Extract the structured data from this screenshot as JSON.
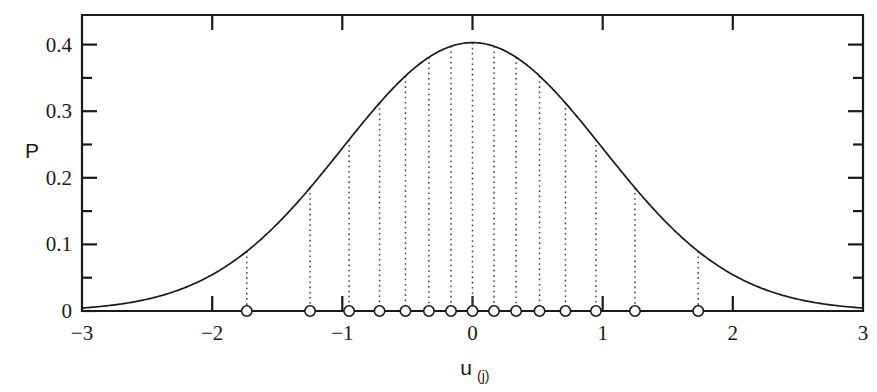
{
  "chart_data": {
    "type": "line",
    "title": "",
    "subtitle": "",
    "xlabel": "u",
    "xlabel_sub": "(j)",
    "ylabel": "P",
    "xlim": [
      -3,
      3
    ],
    "ylim": [
      0,
      0.44
    ],
    "grid": false,
    "legend": null,
    "x_ticks_major": [
      -3,
      -2,
      -1,
      0,
      1,
      2,
      3
    ],
    "x_tick_labels": [
      "−3",
      "−2",
      "−1",
      "0",
      "1",
      "2",
      "3"
    ],
    "y_ticks_major": [
      0,
      0.1,
      0.2,
      0.3,
      0.4
    ],
    "y_tick_labels": [
      "0",
      "0.1",
      "0.2",
      "0.3",
      "0.4"
    ],
    "y_ticks_minor": [
      0.05,
      0.15,
      0.25,
      0.35
    ],
    "series": [
      {
        "name": "standard normal density",
        "type": "line",
        "description": "P = (1/sqrt(2*pi)) * exp(-u^2/2)",
        "peak_value": 0.3989,
        "peak_x": 0
      },
      {
        "name": "normal quantile points",
        "type": "scatter",
        "n_points": 16,
        "marker": "open-circle",
        "y": 0,
        "x": [
          -1.734,
          -1.248,
          -0.948,
          -0.714,
          -0.515,
          -0.335,
          -0.165,
          0.0,
          0.165,
          0.335,
          0.515,
          0.714,
          0.948,
          1.248,
          1.734,
          0.0
        ],
        "x_used": [
          -1.734,
          -1.248,
          -0.948,
          -0.714,
          -0.515,
          -0.335,
          -0.165,
          0.0,
          0.165,
          0.335,
          0.515,
          0.714,
          0.948,
          1.248,
          1.734
        ],
        "droplines_to_curve": true,
        "dropline_heights": [
          0.0884,
          0.1826,
          0.2546,
          0.309,
          0.3478,
          0.3769,
          0.3935,
          0.3989,
          0.3935,
          0.3769,
          0.3478,
          0.309,
          0.2546,
          0.1826,
          0.0884
        ]
      }
    ],
    "quantile_x_values": [
      -1.734,
      -1.248,
      -0.948,
      -0.714,
      -0.515,
      -0.335,
      -0.165,
      0.0,
      0.165,
      0.335,
      0.515,
      0.714,
      0.948,
      1.248,
      1.734
    ],
    "extra_marker_x": 1.734
  }
}
